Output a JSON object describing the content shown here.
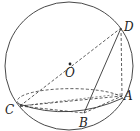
{
  "diagram": {
    "type": "sphere-geometry",
    "sphere": {
      "center_label": "O",
      "cx": 69,
      "cy": 66,
      "r": 64
    },
    "section_ellipse": {
      "cx": 71,
      "cy": 101,
      "rx": 52,
      "ry": 12
    },
    "points": {
      "O": {
        "label": "O",
        "x": 70,
        "y": 64
      },
      "A": {
        "label": "A",
        "x": 122,
        "y": 96
      },
      "B": {
        "label": "B",
        "x": 84,
        "y": 113
      },
      "C": {
        "label": "C",
        "x": 20,
        "y": 106
      },
      "D": {
        "label": "D",
        "x": 121,
        "y": 28
      }
    },
    "segments": [
      {
        "from": "C",
        "to": "D",
        "style": "dashed",
        "note": "passes through O"
      },
      {
        "from": "D",
        "to": "B",
        "style": "solid"
      },
      {
        "from": "D",
        "to": "A",
        "style": "dashed"
      },
      {
        "from": "C",
        "to": "A",
        "style": "dashed"
      },
      {
        "from": "C",
        "to": "B",
        "style": "dashed"
      },
      {
        "from": "B",
        "to": "A",
        "style": "dashed"
      }
    ],
    "colors": {
      "stroke": "#333333",
      "background": "#ffffff"
    }
  }
}
